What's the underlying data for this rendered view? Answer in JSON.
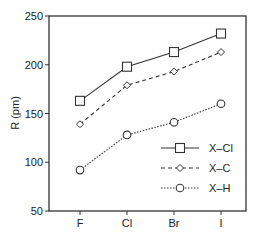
{
  "chart_data": {
    "type": "line",
    "title": "",
    "xlabel": "",
    "ylabel": "R (pm)",
    "categories": [
      "F",
      "Cl",
      "Br",
      "I"
    ],
    "ylim": [
      50,
      250
    ],
    "yticks": [
      50,
      100,
      150,
      200,
      250
    ],
    "grid": false,
    "legend_position": "lower right",
    "series": [
      {
        "name": "X–Cl",
        "marker": "square",
        "linestyle": "solid",
        "values": [
          163,
          198,
          213,
          232
        ]
      },
      {
        "name": "X–C",
        "marker": "diamond",
        "linestyle": "dashed",
        "values": [
          139,
          179,
          193,
          213
        ]
      },
      {
        "name": "X–H",
        "marker": "circle",
        "linestyle": "dotted",
        "values": [
          92,
          128,
          141,
          160
        ]
      }
    ]
  },
  "colors": {
    "line": "#333333",
    "axis": "#333333",
    "background": "#ffffff"
  }
}
